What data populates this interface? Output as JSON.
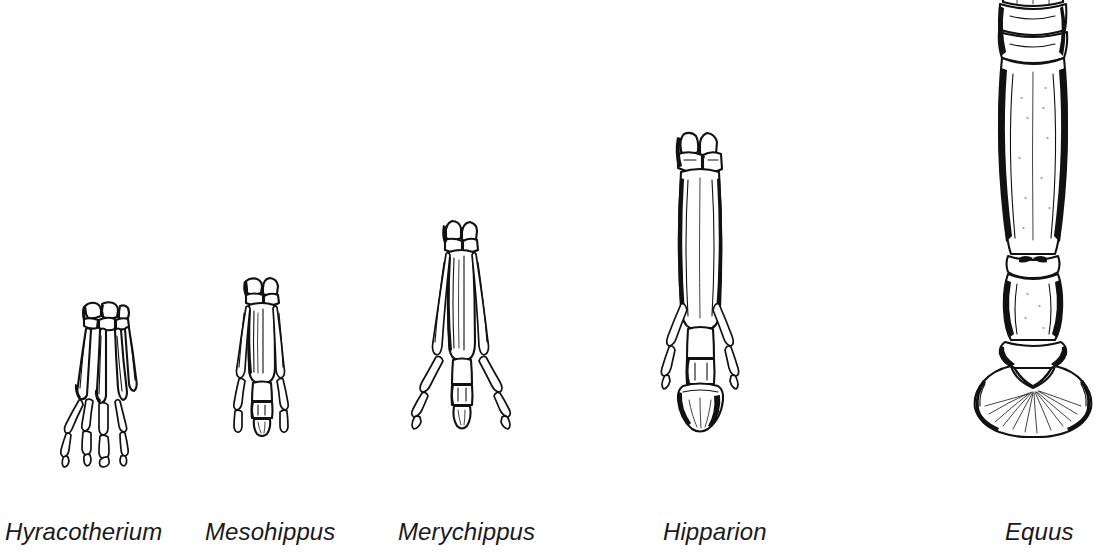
{
  "figure": {
    "background_color": "#ffffff",
    "ink_color": "#111111",
    "label_color": "#1a1a1a",
    "width": 1107,
    "height": 560
  },
  "specimens": [
    {
      "id": "hyracotherium",
      "label": "Hyracotherium",
      "label_x": 5,
      "label_y": 532,
      "toe_count": 4,
      "relative_size": "smallest",
      "art_x": 55,
      "art_y": 300,
      "art_w": 100,
      "art_h": 165
    },
    {
      "id": "mesohippus",
      "label": "Mesohippus",
      "label_x": 205,
      "label_y": 532,
      "toe_count": 3,
      "relative_size": "small",
      "art_x": 215,
      "art_y": 275,
      "art_w": 95,
      "art_h": 160
    },
    {
      "id": "merychippus",
      "label": "Merychippus",
      "label_x": 398,
      "label_y": 532,
      "toe_count": 3,
      "relative_size": "medium",
      "art_x": 405,
      "art_y": 218,
      "art_w": 115,
      "art_h": 218
    },
    {
      "id": "hipparion",
      "label": "Hipparion",
      "label_x": 663,
      "label_y": 532,
      "toe_count": 3,
      "relative_size": "large",
      "art_x": 650,
      "art_y": 128,
      "art_w": 110,
      "art_h": 305
    },
    {
      "id": "equus",
      "label": "Equus",
      "label_x": 1005,
      "label_y": 532,
      "toe_count": 1,
      "relative_size": "largest",
      "art_x": 955,
      "art_y": -12,
      "art_w": 155,
      "art_h": 448
    }
  ]
}
